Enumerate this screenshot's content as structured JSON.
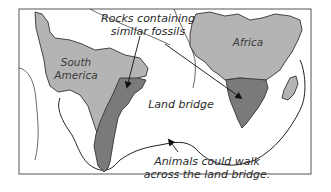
{
  "diagram": {
    "type": "map-illustration",
    "colors": {
      "background": "#ffffff",
      "frame": "#555555",
      "continent_fill": "#b4b4b4",
      "fossil_rock_fill": "#7a7a7a",
      "outline": "#333333",
      "text": "#2a2a2a"
    },
    "regions": [
      {
        "id": "south-america",
        "label_line1": "South",
        "label_line2": "America"
      },
      {
        "id": "africa",
        "label": "Africa"
      },
      {
        "id": "madagascar",
        "label": ""
      }
    ],
    "callouts": {
      "rocks": {
        "line1": "Rocks containing",
        "line2": "similar fossils"
      },
      "land_bridge": {
        "label": "Land bridge"
      },
      "animals": {
        "line1": "Animals could walk",
        "line2": "across the land bridge."
      }
    }
  }
}
